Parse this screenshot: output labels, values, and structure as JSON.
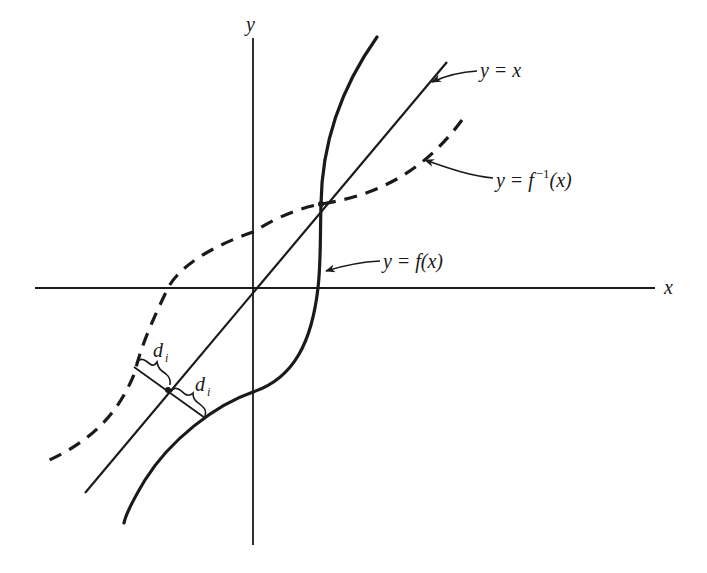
{
  "figure": {
    "type": "function-inverse-reflection-diagram",
    "axes": {
      "x_label": "x",
      "y_label": "y"
    },
    "curves": [
      {
        "id": "identity",
        "label": "y = x",
        "style": "solid-thin"
      },
      {
        "id": "f",
        "label": "y = f(x)",
        "style": "solid-thick"
      },
      {
        "id": "f_inverse",
        "label": "y = f^{-1}(x)",
        "style": "dashed-thick"
      }
    ],
    "labels": {
      "identity": {
        "lhs": "y",
        "eq": "=",
        "rhs": "x"
      },
      "f": {
        "lhs": "y",
        "eq": "=",
        "rhs": "f(x)"
      },
      "f_inverse": {
        "lhs": "y",
        "eq": "=",
        "rhs_base": "f",
        "rhs_sup": "−1",
        "rhs_arg": "(x)"
      }
    },
    "distance_annotations": [
      {
        "symbol": "d",
        "subscript": "i",
        "between": [
          "f_inverse",
          "identity"
        ]
      },
      {
        "symbol": "d",
        "subscript": "i",
        "between": [
          "identity",
          "f"
        ]
      }
    ],
    "colors": {
      "ink": "#1a1a1a",
      "background": "#ffffff"
    }
  }
}
